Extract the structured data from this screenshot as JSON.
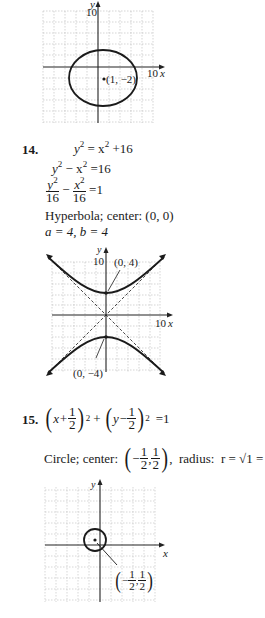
{
  "graph_13": {
    "y_axis_label": "y",
    "x_axis_label": "x",
    "y_tick": "10",
    "x_tick": "10",
    "center_label": "(1, −2)"
  },
  "problem_14": {
    "number": "14.",
    "line1": {
      "lhs": "y",
      "lhs_exp": "2",
      "eq": " = x",
      "rhs_exp": "2",
      "rest": " +16"
    },
    "line2": {
      "a": "y",
      "a_exp": "2",
      "mid": " − x",
      "b_exp": "2",
      "rest": " =16"
    },
    "line3": {
      "n1": "y",
      "n1_exp": "2",
      "d1": "16",
      "op": "−",
      "n2": "x",
      "n2_exp": "2",
      "d2": "16",
      "rest": "=1"
    },
    "classification": "Hyperbola; center: (0, 0)",
    "params": "a = 4, b = 4",
    "graph": {
      "y_axis_label": "y",
      "x_axis_label": "x",
      "y_tick": "10",
      "x_tick": "10",
      "vertex_top_label": "(0, 4)",
      "vertex_bottom_label": "(0, −4)"
    }
  },
  "problem_15": {
    "number": "15.",
    "equation": {
      "open1": "(",
      "x_term": "x+",
      "f1_n": "1",
      "f1_d": "2",
      "close1": ")",
      "exp1": "2",
      "plus": "+",
      "open2": "(",
      "y_term": "y−",
      "f2_n": "1",
      "f2_d": "2",
      "close2": ")",
      "exp2": "2",
      "rest": "=1"
    },
    "classification_prefix": "Circle; center:",
    "center": {
      "open": "(",
      "neg": "−",
      "f1_n": "1",
      "f1_d": "2",
      "comma": ",",
      "f2_n": "1",
      "f2_d": "2",
      "close": ")"
    },
    "radius_text": ",  radius:  r = √1 = 1",
    "graph": {
      "y_axis_label": "y",
      "x_axis_label": "x",
      "center_label": {
        "open": "(",
        "neg": "−",
        "f1_n": "1",
        "f1_d": "2",
        "comma": ",",
        "f2_n": "1",
        "f2_d": "2",
        "close": ")"
      }
    }
  }
}
